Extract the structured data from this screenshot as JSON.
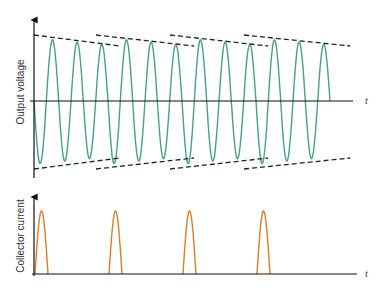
{
  "upper_plot": {
    "ylabel": "Output voltage",
    "xlabel": "t",
    "wave_color": "#4a9e8e",
    "envelope_color": "#222222"
  },
  "lower_plot": {
    "ylabel": "Collector current",
    "xlabel": "t",
    "pulse_color": "#e07b2a"
  },
  "chart_data": [
    {
      "type": "line",
      "title": "",
      "ylabel": "Output voltage",
      "xlabel": "t",
      "description": "Damped sinusoidal oscillation with periodic restoring kicks; dashed lines show decaying amplitude envelopes restarted every 3 cycles",
      "cycles": 12,
      "cycles_per_kick": 3,
      "envelope_segments": 4,
      "grid": false
    },
    {
      "type": "line",
      "title": "",
      "ylabel": "Collector current",
      "xlabel": "t",
      "description": "Narrow half-sine current pulses, one every 3 oscillation cycles",
      "pulses": 4,
      "grid": false
    }
  ]
}
